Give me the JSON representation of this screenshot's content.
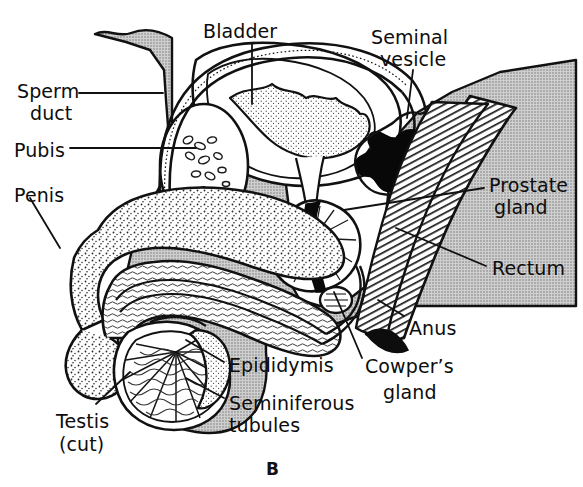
{
  "figure": {
    "letter": "B",
    "background_color": "#ffffff",
    "tissue_gray": "#b9b9b9",
    "ink_color": "#111111"
  },
  "labels": {
    "bladder": {
      "text": "Bladder",
      "x": 203,
      "y": 21
    },
    "seminal_vesicle_l1": {
      "text": "Seminal",
      "x": 371,
      "y": 26
    },
    "seminal_vesicle_l2": {
      "text": "vesicle",
      "x": 380,
      "y": 48
    },
    "sperm_duct_l1": {
      "text": "Sperm",
      "x": 17,
      "y": 80
    },
    "sperm_duct_l2": {
      "text": "duct",
      "x": 30,
      "y": 102
    },
    "pubis": {
      "text": "Pubis",
      "x": 14,
      "y": 140
    },
    "penis": {
      "text": "Penis",
      "x": 14,
      "y": 185
    },
    "prostate_l1": {
      "text": "Prostate",
      "x": 489,
      "y": 174
    },
    "prostate_l2": {
      "text": "gland",
      "x": 494,
      "y": 196
    },
    "rectum": {
      "text": "Rectum",
      "x": 492,
      "y": 258
    },
    "anus": {
      "text": "Anus",
      "x": 409,
      "y": 318
    },
    "epididymis": {
      "text": "Epididymis",
      "x": 229,
      "y": 355
    },
    "cowpers_l1": {
      "text": "Cowper’s",
      "x": 365,
      "y": 355
    },
    "cowpers_l2": {
      "text": "gland",
      "x": 383,
      "y": 381
    },
    "seminiferous_l1": {
      "text": "Seminiferous",
      "x": 229,
      "y": 392
    },
    "seminiferous_l2": {
      "text": "tubules",
      "x": 229,
      "y": 414
    },
    "testis_l1": {
      "text": "Testis",
      "x": 56,
      "y": 410
    },
    "testis_l2": {
      "text": "(cut)",
      "x": 59,
      "y": 433
    }
  },
  "structures": [
    {
      "name": "bladder",
      "label": "Bladder"
    },
    {
      "name": "seminal-vesicle",
      "label": "Seminal vesicle"
    },
    {
      "name": "sperm-duct",
      "label": "Sperm duct"
    },
    {
      "name": "pubis",
      "label": "Pubis"
    },
    {
      "name": "penis",
      "label": "Penis"
    },
    {
      "name": "prostate-gland",
      "label": "Prostate gland"
    },
    {
      "name": "rectum",
      "label": "Rectum"
    },
    {
      "name": "anus",
      "label": "Anus"
    },
    {
      "name": "epididymis",
      "label": "Epididymis"
    },
    {
      "name": "cowpers-gland",
      "label": "Cowper’s gland"
    },
    {
      "name": "seminiferous-tubules",
      "label": "Seminiferous tubules"
    },
    {
      "name": "testis",
      "label": "Testis (cut)"
    }
  ]
}
